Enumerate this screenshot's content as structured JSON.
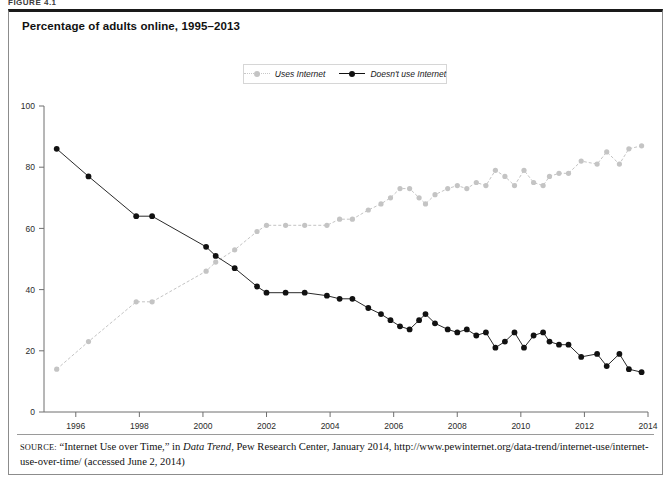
{
  "figure": {
    "label": "FIGURE 4.1",
    "title": "Percentage of adults online, 1995–2013"
  },
  "legend": {
    "position": "top-center",
    "entries": [
      {
        "label": "Uses Internet",
        "color": "#c4c4c4",
        "marker": "circle",
        "line": "dotted"
      },
      {
        "label": "Doesn't use Internet",
        "color": "#111111",
        "marker": "circle",
        "line": "solid"
      }
    ]
  },
  "axes": {
    "y_ticks": [
      "0",
      "20",
      "40",
      "60",
      "80",
      "100"
    ],
    "x_ticks": [
      "1996",
      "1998",
      "2000",
      "2002",
      "2004",
      "2006",
      "2008",
      "2010",
      "2012",
      "2014"
    ]
  },
  "source": {
    "prefix": "SOURCE:",
    "text_1": " “Internet Use over Time,” in ",
    "italic": "Data Trend",
    "text_2": ", Pew Research Center, January 2014, http://www.pewinternet.org/data-trend/internet-use/internet-use-over-time/ (accessed June 2, 2014)"
  },
  "chart_data": {
    "type": "line",
    "title": "Percentage of adults online, 1995–2013",
    "xlabel": "",
    "ylabel": "",
    "xlim": [
      1995.0,
      2014.0
    ],
    "ylim": [
      0,
      100
    ],
    "grid": false,
    "legend_position": "top-center",
    "series": [
      {
        "name": "Uses Internet",
        "color": "#c4c4c4",
        "points": [
          [
            1995.4,
            14
          ],
          [
            1996.4,
            23
          ],
          [
            1997.9,
            36
          ],
          [
            1998.4,
            36
          ],
          [
            2000.1,
            46
          ],
          [
            2000.4,
            49
          ],
          [
            2001.0,
            53
          ],
          [
            2001.7,
            59
          ],
          [
            2002.0,
            61
          ],
          [
            2002.6,
            61
          ],
          [
            2003.2,
            61
          ],
          [
            2003.9,
            61
          ],
          [
            2004.3,
            63
          ],
          [
            2004.7,
            63
          ],
          [
            2005.2,
            66
          ],
          [
            2005.6,
            68
          ],
          [
            2005.9,
            70
          ],
          [
            2006.2,
            73
          ],
          [
            2006.5,
            73
          ],
          [
            2006.8,
            70
          ],
          [
            2007.0,
            68
          ],
          [
            2007.3,
            71
          ],
          [
            2007.7,
            73
          ],
          [
            2008.0,
            74
          ],
          [
            2008.3,
            73
          ],
          [
            2008.6,
            75
          ],
          [
            2008.9,
            74
          ],
          [
            2009.2,
            79
          ],
          [
            2009.5,
            77
          ],
          [
            2009.8,
            74
          ],
          [
            2010.1,
            79
          ],
          [
            2010.4,
            75
          ],
          [
            2010.7,
            74
          ],
          [
            2010.9,
            77
          ],
          [
            2011.2,
            78
          ],
          [
            2011.5,
            78
          ],
          [
            2011.9,
            82
          ],
          [
            2012.4,
            81
          ],
          [
            2012.7,
            85
          ],
          [
            2013.1,
            81
          ],
          [
            2013.4,
            86
          ],
          [
            2013.8,
            87
          ]
        ]
      },
      {
        "name": "Doesn't use Internet",
        "color": "#111111",
        "points": [
          [
            1995.4,
            86
          ],
          [
            1996.4,
            77
          ],
          [
            1997.9,
            64
          ],
          [
            1998.4,
            64
          ],
          [
            2000.1,
            54
          ],
          [
            2000.4,
            51
          ],
          [
            2001.0,
            47
          ],
          [
            2001.7,
            41
          ],
          [
            2002.0,
            39
          ],
          [
            2002.6,
            39
          ],
          [
            2003.2,
            39
          ],
          [
            2003.9,
            38
          ],
          [
            2004.3,
            37
          ],
          [
            2004.7,
            37
          ],
          [
            2005.2,
            34
          ],
          [
            2005.6,
            32
          ],
          [
            2005.9,
            30
          ],
          [
            2006.2,
            28
          ],
          [
            2006.5,
            27
          ],
          [
            2006.8,
            30
          ],
          [
            2007.0,
            32
          ],
          [
            2007.3,
            29
          ],
          [
            2007.7,
            27
          ],
          [
            2008.0,
            26
          ],
          [
            2008.3,
            27
          ],
          [
            2008.6,
            25
          ],
          [
            2008.9,
            26
          ],
          [
            2009.2,
            21
          ],
          [
            2009.5,
            23
          ],
          [
            2009.8,
            26
          ],
          [
            2010.1,
            21
          ],
          [
            2010.4,
            25
          ],
          [
            2010.7,
            26
          ],
          [
            2010.9,
            23
          ],
          [
            2011.2,
            22
          ],
          [
            2011.5,
            22
          ],
          [
            2011.9,
            18
          ],
          [
            2012.4,
            19
          ],
          [
            2012.7,
            15
          ],
          [
            2013.1,
            19
          ],
          [
            2013.4,
            14
          ],
          [
            2013.8,
            13
          ]
        ]
      }
    ]
  }
}
